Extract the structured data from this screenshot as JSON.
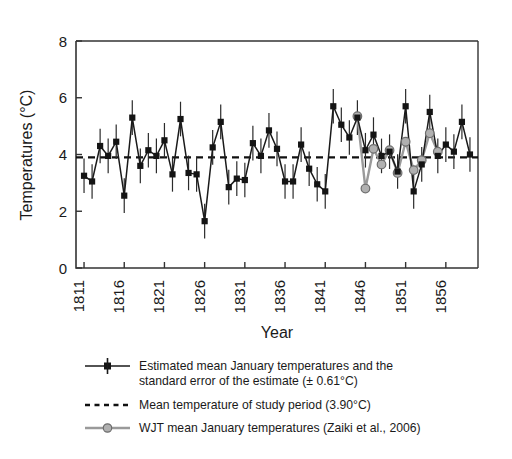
{
  "figure": {
    "background": "#ffffff",
    "axis_color": "#333333",
    "series_color": "#141414",
    "wjt_color": "#b0b0b0",
    "wjt_line_color": "#9a9a9a",
    "mean_line_color": "#111111"
  },
  "chart_data": {
    "type": "line",
    "title": "",
    "xlabel": "Year",
    "ylabel": "Temperatures (°C)",
    "xlim": [
      1810,
      1860
    ],
    "ylim": [
      0,
      8
    ],
    "yticks": [
      0,
      2,
      4,
      6,
      8
    ],
    "ytick_labels": [
      "0",
      "2",
      "4",
      "6",
      "8"
    ],
    "xticks": [
      1811,
      1816,
      1821,
      1826,
      1831,
      1836,
      1841,
      1846,
      1851,
      1856
    ],
    "xtick_labels": [
      "1811",
      "1816",
      "1821",
      "1826",
      "1831",
      "1836",
      "1841",
      "1846",
      "1851",
      "1856"
    ],
    "grid": false,
    "legend_position": "below",
    "error_bar_value": 0.61,
    "mean_value": 3.9,
    "series": [
      {
        "name": "Estimated mean January temperatures",
        "marker": "square",
        "color": "#141414",
        "has_error_bars": true,
        "x": [
          1811,
          1812,
          1813,
          1814,
          1815,
          1816,
          1817,
          1818,
          1819,
          1820,
          1821,
          1822,
          1823,
          1824,
          1825,
          1826,
          1827,
          1828,
          1829,
          1830,
          1831,
          1832,
          1833,
          1834,
          1835,
          1836,
          1837,
          1838,
          1839,
          1840,
          1841,
          1842,
          1843,
          1844,
          1845,
          1846,
          1847,
          1848,
          1849,
          1850,
          1851,
          1852,
          1853,
          1854,
          1855,
          1856,
          1857,
          1858,
          1859
        ],
        "values": [
          3.25,
          3.05,
          4.3,
          3.95,
          4.45,
          2.55,
          5.3,
          3.6,
          4.15,
          3.95,
          4.5,
          3.3,
          5.25,
          3.35,
          3.3,
          1.65,
          4.25,
          5.15,
          2.85,
          3.15,
          3.1,
          4.4,
          3.95,
          4.85,
          4.2,
          3.05,
          3.05,
          4.35,
          3.5,
          2.95,
          2.7,
          5.7,
          5.05,
          4.6,
          5.3,
          4.15,
          4.7,
          3.95,
          4.1,
          3.4,
          5.7,
          2.7,
          3.65,
          5.5,
          3.95,
          4.35,
          4.1,
          5.15,
          4.0
        ]
      },
      {
        "name": "WJT mean January temperatures (Zaiki et al., 2006)",
        "marker": "circle",
        "color": "#b0b0b0",
        "has_error_bars": false,
        "x": [
          1845,
          1846,
          1847,
          1848,
          1849,
          1850,
          1851,
          1852,
          1853,
          1854,
          1855
        ],
        "values": [
          5.35,
          2.8,
          4.2,
          3.65,
          4.15,
          3.35,
          4.45,
          3.45,
          3.8,
          4.75,
          4.1
        ]
      }
    ],
    "reference_line": {
      "label": "Mean temperature of study period",
      "value": 3.9,
      "style": "dashed"
    }
  },
  "legend": {
    "items": [
      {
        "key": "estimated-series",
        "marker": "line-square",
        "line1": "Estimated mean January temperatures and the",
        "line2": "standard error of the estimate (± 0.61°C)"
      },
      {
        "key": "mean-line",
        "marker": "dashed",
        "line1": "Mean temperature of study period (3.90°C)",
        "line2": ""
      },
      {
        "key": "wjt-series",
        "marker": "line-circle",
        "line1": "WJT mean January temperatures (Zaiki et al., 2006)",
        "line2": ""
      }
    ]
  }
}
